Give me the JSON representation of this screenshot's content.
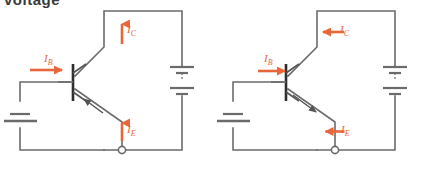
{
  "page": {
    "clipped_heading": "voltage",
    "width": 426,
    "height": 169,
    "background": "#ffffff"
  },
  "style": {
    "wire_color": "#6b6b6b",
    "current_color": "#e8663a",
    "text_color": "#3a3a3a"
  },
  "circuits": [
    {
      "id": "pnp-circuit",
      "name": "pnp-transistor-circuit",
      "transistor_type": "PNP",
      "emitter_arrow_direction": "into-base",
      "position": "left",
      "currents": [
        {
          "name": "collector-current",
          "label_main": "I",
          "label_sub": "C",
          "arrow": "up"
        },
        {
          "name": "base-current",
          "label_main": "I",
          "label_sub": "B",
          "arrow": "right"
        },
        {
          "name": "emitter-current",
          "label_main": "I",
          "label_sub": "E",
          "arrow": "up"
        }
      ],
      "sources": [
        {
          "name": "collector-supply-battery",
          "cells": 2,
          "orientation": "vertical"
        },
        {
          "name": "base-supply-battery",
          "cells": 1,
          "orientation": "vertical"
        }
      ],
      "node": {
        "name": "common-node",
        "shape": "circle"
      }
    },
    {
      "id": "npn-circuit",
      "name": "npn-transistor-circuit",
      "transistor_type": "NPN",
      "emitter_arrow_direction": "out-of-base",
      "position": "right",
      "currents": [
        {
          "name": "collector-current",
          "label_main": "I",
          "label_sub": "C",
          "arrow": "down"
        },
        {
          "name": "base-current",
          "label_main": "I",
          "label_sub": "B",
          "arrow": "right"
        },
        {
          "name": "emitter-current",
          "label_main": "I",
          "label_sub": "E",
          "arrow": "down"
        }
      ],
      "sources": [
        {
          "name": "collector-supply-battery",
          "cells": 2,
          "orientation": "vertical"
        },
        {
          "name": "base-supply-battery",
          "cells": 1,
          "orientation": "vertical"
        }
      ],
      "node": {
        "name": "common-node",
        "shape": "circle"
      }
    }
  ]
}
